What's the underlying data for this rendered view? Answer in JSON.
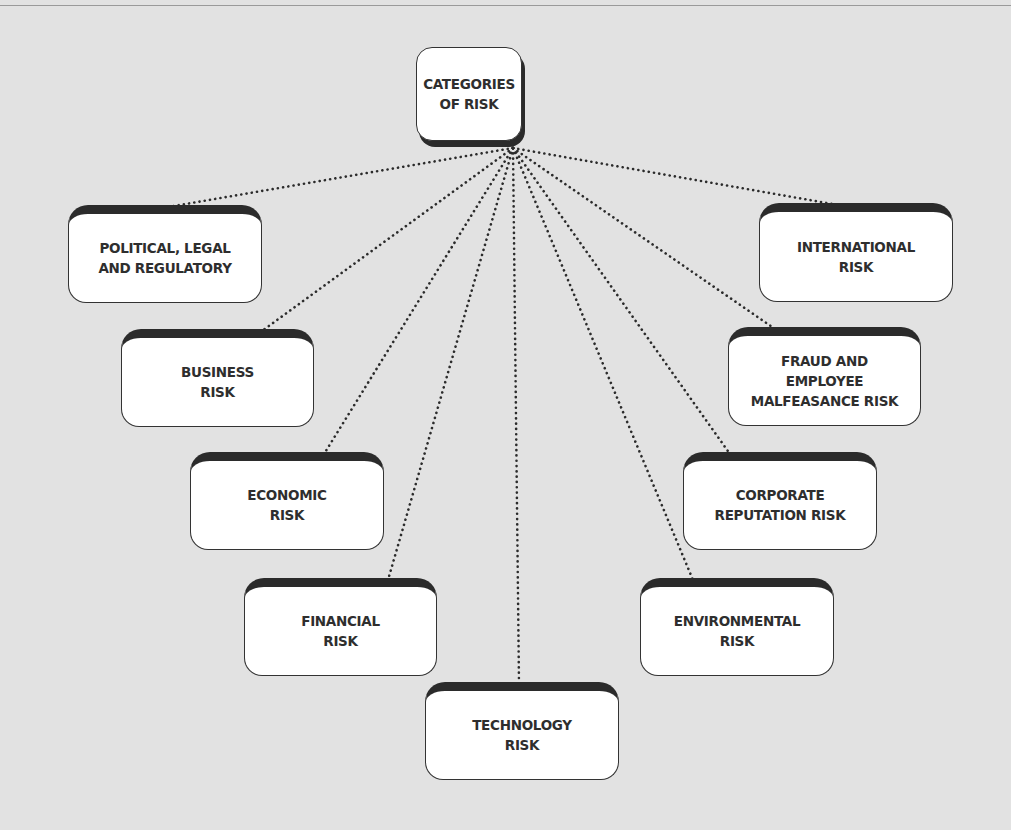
{
  "diagram": {
    "type": "hub-and-spoke",
    "root": {
      "id": "root",
      "label": "CATEGORIES\nOF RISK",
      "x": 416,
      "y": 47,
      "w": 106,
      "h": 94
    },
    "hub_point": {
      "x": 513,
      "y": 148
    },
    "connector_style": "dotted",
    "colors": {
      "background": "#e2e2e2",
      "box_fill": "#ffffff",
      "box_border": "#333333",
      "box_header": "#2b2b2b",
      "text": "#2e2e2e"
    },
    "categories": [
      {
        "id": "political",
        "label": "POLITICAL, LEGAL\nAND REGULATORY",
        "x": 68,
        "y": 205,
        "w": 194,
        "h": 98,
        "anchor_x": 168
      },
      {
        "id": "business",
        "label": "BUSINESS\nRISK",
        "x": 121,
        "y": 329,
        "w": 193,
        "h": 98,
        "anchor_x": 262
      },
      {
        "id": "economic",
        "label": "ECONOMIC\nRISK",
        "x": 190,
        "y": 452,
        "w": 194,
        "h": 98,
        "anchor_x": 324
      },
      {
        "id": "financial",
        "label": "FINANCIAL\nRISK",
        "x": 244,
        "y": 578,
        "w": 193,
        "h": 98,
        "anchor_x": 388
      },
      {
        "id": "technology",
        "label": "TECHNOLOGY\nRISK",
        "x": 425,
        "y": 682,
        "w": 194,
        "h": 98,
        "anchor_x": 519
      },
      {
        "id": "international",
        "label": "INTERNATIONAL\nRISK",
        "x": 759,
        "y": 203,
        "w": 194,
        "h": 99,
        "anchor_x": 838
      },
      {
        "id": "fraud",
        "label": "FRAUD AND\nEMPLOYEE\nMALFEASANCE RISK",
        "x": 728,
        "y": 327,
        "w": 193,
        "h": 99,
        "anchor_x": 775
      },
      {
        "id": "corporate",
        "label": "CORPORATE\nREPUTATION RISK",
        "x": 683,
        "y": 452,
        "w": 194,
        "h": 98,
        "anchor_x": 730
      },
      {
        "id": "environmental",
        "label": "ENVIRONMENTAL\nRISK",
        "x": 640,
        "y": 578,
        "w": 194,
        "h": 98,
        "anchor_x": 693
      }
    ]
  }
}
